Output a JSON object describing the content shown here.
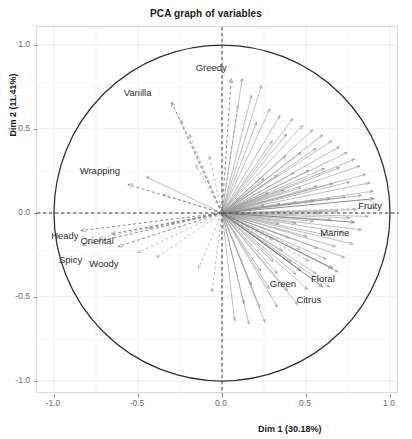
{
  "chart_data": {
    "type": "scatter",
    "subtype": "pca-correlation-circle-biplot",
    "title": "PCA graph of variables",
    "xlabel": "Dim 1 (30.18%)",
    "ylabel": "Dim 2 (11.41%)",
    "xlim": [
      -1.15,
      1.15
    ],
    "ylim": [
      -1.15,
      1.15
    ],
    "xticks": [
      "-1.0",
      "-0.5",
      "0.0",
      "0.5",
      "1.0"
    ],
    "yticks": [
      "1.0",
      "0.5",
      "0.0",
      "-0.5",
      "-1.0"
    ],
    "xtick_values": [
      -1.0,
      -0.5,
      0.0,
      0.5,
      1.0
    ],
    "ytick_values": [
      1.0,
      0.5,
      0.0,
      -0.5,
      -1.0
    ],
    "grid": true,
    "legend": "none",
    "unit_circle_radius": 1.0,
    "origin": [
      0.0,
      0.0
    ],
    "explained_variance": {
      "dim1_percent": 30.18,
      "dim2_percent": 11.41
    },
    "labeled_variables": [
      {
        "label": "Greedy",
        "x": 0.055,
        "y": 0.8,
        "style": "dashed",
        "label_dx": -20,
        "label_dy": -12
      },
      {
        "label": "Vanilla",
        "x": -0.3,
        "y": 0.66,
        "style": "dashed",
        "label_dx": -34,
        "label_dy": -10
      },
      {
        "label": "Wrapping",
        "x": -0.56,
        "y": 0.17,
        "style": "dashed",
        "label_dx": -28,
        "label_dy": -14
      },
      {
        "label": "Heady",
        "x": -0.84,
        "y": -0.105,
        "style": "dashed",
        "label_dx": -16,
        "label_dy": 4
      },
      {
        "label": "Oriental",
        "x": -0.66,
        "y": -0.125,
        "style": "dashed",
        "label_dx": -14,
        "label_dy": 6
      },
      {
        "label": "Spicy",
        "x": -0.83,
        "y": -0.19,
        "style": "dashed",
        "label_dx": -12,
        "label_dy": 14
      },
      {
        "label": "Woody",
        "x": -0.62,
        "y": -0.2,
        "style": "dashed",
        "label_dx": -14,
        "label_dy": 16
      },
      {
        "label": "Fruity",
        "x": 0.905,
        "y": 0.085,
        "style": "solid",
        "label_dx": -4,
        "label_dy": 6
      },
      {
        "label": "Marine",
        "x": 0.79,
        "y": -0.055,
        "style": "solid",
        "label_dx": -20,
        "label_dy": 10
      },
      {
        "label": "Floral",
        "x": 0.66,
        "y": -0.33,
        "style": "solid",
        "label_dx": -10,
        "label_dy": 10
      },
      {
        "label": "Green",
        "x": 0.47,
        "y": -0.345,
        "style": "solid",
        "label_dx": -18,
        "label_dy": 12
      },
      {
        "label": "Citrus",
        "x": 0.6,
        "y": -0.44,
        "style": "solid",
        "label_dx": -14,
        "label_dy": 12
      }
    ],
    "unlabeled_vectors": [
      {
        "x": 0.12,
        "y": 0.8,
        "style": "solid"
      },
      {
        "x": 0.235,
        "y": 0.76,
        "style": "solid"
      },
      {
        "x": 0.175,
        "y": 0.7,
        "style": "solid"
      },
      {
        "x": 0.095,
        "y": 0.64,
        "style": "dashed"
      },
      {
        "x": -0.245,
        "y": 0.555,
        "style": "dashed"
      },
      {
        "x": -0.195,
        "y": 0.47,
        "style": "dashed"
      },
      {
        "x": 0.285,
        "y": 0.62,
        "style": "solid"
      },
      {
        "x": 0.345,
        "y": 0.58,
        "style": "solid"
      },
      {
        "x": 0.205,
        "y": 0.54,
        "style": "solid"
      },
      {
        "x": 0.42,
        "y": 0.56,
        "style": "solid"
      },
      {
        "x": 0.48,
        "y": 0.52,
        "style": "solid"
      },
      {
        "x": 0.54,
        "y": 0.495,
        "style": "solid"
      },
      {
        "x": 0.6,
        "y": 0.465,
        "style": "solid"
      },
      {
        "x": 0.385,
        "y": 0.47,
        "style": "solid"
      },
      {
        "x": 0.3,
        "y": 0.43,
        "style": "solid"
      },
      {
        "x": 0.655,
        "y": 0.43,
        "style": "solid"
      },
      {
        "x": 0.7,
        "y": 0.395,
        "style": "solid"
      },
      {
        "x": 0.745,
        "y": 0.36,
        "style": "solid"
      },
      {
        "x": 0.56,
        "y": 0.385,
        "style": "solid"
      },
      {
        "x": 0.47,
        "y": 0.36,
        "style": "solid"
      },
      {
        "x": 0.38,
        "y": 0.34,
        "style": "solid"
      },
      {
        "x": 0.79,
        "y": 0.32,
        "style": "solid"
      },
      {
        "x": 0.82,
        "y": 0.28,
        "style": "solid"
      },
      {
        "x": 0.7,
        "y": 0.27,
        "style": "solid"
      },
      {
        "x": 0.61,
        "y": 0.265,
        "style": "solid"
      },
      {
        "x": 0.52,
        "y": 0.255,
        "style": "solid"
      },
      {
        "x": 0.43,
        "y": 0.24,
        "style": "solid"
      },
      {
        "x": 0.33,
        "y": 0.225,
        "style": "solid"
      },
      {
        "x": 0.25,
        "y": 0.205,
        "style": "solid"
      },
      {
        "x": 0.855,
        "y": 0.23,
        "style": "solid"
      },
      {
        "x": 0.88,
        "y": 0.18,
        "style": "solid"
      },
      {
        "x": 0.76,
        "y": 0.185,
        "style": "solid"
      },
      {
        "x": 0.66,
        "y": 0.175,
        "style": "solid"
      },
      {
        "x": 0.565,
        "y": 0.16,
        "style": "solid"
      },
      {
        "x": 0.47,
        "y": 0.15,
        "style": "solid"
      },
      {
        "x": 0.37,
        "y": 0.135,
        "style": "solid"
      },
      {
        "x": 0.275,
        "y": 0.12,
        "style": "solid"
      },
      {
        "x": 0.9,
        "y": 0.13,
        "style": "solid"
      },
      {
        "x": 0.83,
        "y": 0.105,
        "style": "solid"
      },
      {
        "x": 0.735,
        "y": 0.095,
        "style": "solid"
      },
      {
        "x": 0.64,
        "y": 0.085,
        "style": "solid"
      },
      {
        "x": 0.545,
        "y": 0.075,
        "style": "solid"
      },
      {
        "x": 0.445,
        "y": 0.065,
        "style": "solid"
      },
      {
        "x": 0.345,
        "y": 0.055,
        "style": "solid"
      },
      {
        "x": 0.25,
        "y": 0.045,
        "style": "solid"
      },
      {
        "x": 0.91,
        "y": 0.03,
        "style": "dashed"
      },
      {
        "x": 0.8,
        "y": 0.02,
        "style": "solid"
      },
      {
        "x": 0.69,
        "y": 0.01,
        "style": "solid"
      },
      {
        "x": 0.58,
        "y": 0.0,
        "style": "solid"
      },
      {
        "x": 0.87,
        "y": -0.02,
        "style": "solid"
      },
      {
        "x": 0.76,
        "y": -0.03,
        "style": "solid"
      },
      {
        "x": 0.65,
        "y": -0.04,
        "style": "solid"
      },
      {
        "x": 0.545,
        "y": -0.05,
        "style": "solid"
      },
      {
        "x": 0.44,
        "y": -0.06,
        "style": "solid"
      },
      {
        "x": 0.34,
        "y": -0.065,
        "style": "solid"
      },
      {
        "x": 0.83,
        "y": -0.1,
        "style": "solid"
      },
      {
        "x": 0.72,
        "y": -0.115,
        "style": "solid"
      },
      {
        "x": 0.615,
        "y": -0.13,
        "style": "solid"
      },
      {
        "x": 0.505,
        "y": -0.14,
        "style": "solid"
      },
      {
        "x": 0.4,
        "y": -0.15,
        "style": "solid"
      },
      {
        "x": 0.3,
        "y": -0.155,
        "style": "solid"
      },
      {
        "x": 0.78,
        "y": -0.185,
        "style": "solid"
      },
      {
        "x": 0.675,
        "y": -0.2,
        "style": "solid"
      },
      {
        "x": 0.57,
        "y": -0.21,
        "style": "solid"
      },
      {
        "x": 0.465,
        "y": -0.22,
        "style": "dashed"
      },
      {
        "x": 0.36,
        "y": -0.225,
        "style": "solid"
      },
      {
        "x": 0.73,
        "y": -0.265,
        "style": "solid"
      },
      {
        "x": 0.62,
        "y": -0.275,
        "style": "solid"
      },
      {
        "x": 0.515,
        "y": -0.285,
        "style": "dashed"
      },
      {
        "x": 0.41,
        "y": -0.29,
        "style": "solid"
      },
      {
        "x": 0.305,
        "y": -0.29,
        "style": "solid"
      },
      {
        "x": 0.69,
        "y": -0.35,
        "style": "solid"
      },
      {
        "x": 0.56,
        "y": -0.36,
        "style": "solid"
      },
      {
        "x": 0.44,
        "y": -0.365,
        "style": "solid"
      },
      {
        "x": 0.33,
        "y": -0.36,
        "style": "solid"
      },
      {
        "x": 0.23,
        "y": -0.345,
        "style": "solid"
      },
      {
        "x": 0.64,
        "y": -0.44,
        "style": "solid"
      },
      {
        "x": 0.51,
        "y": -0.455,
        "style": "solid"
      },
      {
        "x": 0.39,
        "y": -0.46,
        "style": "solid"
      },
      {
        "x": 0.28,
        "y": -0.45,
        "style": "solid"
      },
      {
        "x": 0.175,
        "y": -0.43,
        "style": "solid"
      },
      {
        "x": 0.45,
        "y": -0.545,
        "style": "solid"
      },
      {
        "x": 0.33,
        "y": -0.56,
        "style": "solid"
      },
      {
        "x": 0.225,
        "y": -0.56,
        "style": "solid"
      },
      {
        "x": 0.13,
        "y": -0.54,
        "style": "solid"
      },
      {
        "x": 0.255,
        "y": -0.65,
        "style": "solid"
      },
      {
        "x": 0.16,
        "y": -0.66,
        "style": "solid"
      },
      {
        "x": 0.075,
        "y": -0.64,
        "style": "solid"
      },
      {
        "x": -0.06,
        "y": -0.47,
        "style": "dashed"
      },
      {
        "x": -0.14,
        "y": -0.33,
        "style": "dashed"
      },
      {
        "x": -0.39,
        "y": -0.265,
        "style": "dashed"
      },
      {
        "x": -0.5,
        "y": -0.235,
        "style": "dashed"
      },
      {
        "x": -0.73,
        "y": -0.15,
        "style": "dashed"
      },
      {
        "x": -0.44,
        "y": -0.09,
        "style": "dashed"
      },
      {
        "x": -0.3,
        "y": -0.06,
        "style": "dashed"
      },
      {
        "x": -0.35,
        "y": 0.11,
        "style": "dashed"
      },
      {
        "x": -0.45,
        "y": 0.215,
        "style": "solid"
      },
      {
        "x": -0.155,
        "y": 0.285,
        "style": "dashed"
      },
      {
        "x": -0.075,
        "y": 0.34,
        "style": "dashed"
      }
    ]
  }
}
